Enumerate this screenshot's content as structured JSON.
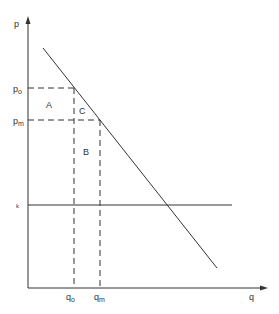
{
  "diagram": {
    "axes": {
      "y_label": "p",
      "x_label": "q"
    },
    "price_labels": {
      "p_o": {
        "base": "p",
        "sub": "o"
      },
      "p_m": {
        "base": "p",
        "sub": "m"
      },
      "k": "k"
    },
    "quantity_labels": {
      "q_o": {
        "base": "q",
        "sub": "o"
      },
      "q_m": {
        "base": "q",
        "sub": "m"
      }
    },
    "regions": {
      "A": "A",
      "B": "B",
      "C": "C"
    },
    "colors": {
      "line": "#333333",
      "background": "#ffffff"
    }
  }
}
